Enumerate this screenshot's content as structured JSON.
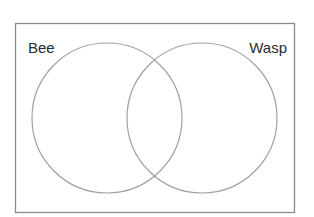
{
  "diagram": {
    "type": "venn",
    "frame": {
      "x": 15,
      "y": 23,
      "width": 279,
      "height": 189,
      "stroke": "#8a8a8a"
    },
    "sets": [
      {
        "label": "Bee",
        "cx": 107,
        "cy": 118,
        "r": 75,
        "label_x": 28,
        "label_y": 53,
        "anchor": "start"
      },
      {
        "label": "Wasp",
        "cx": 202,
        "cy": 118,
        "r": 75,
        "label_x": 287,
        "label_y": 53,
        "anchor": "end"
      }
    ],
    "circle_stroke": "#a0a0a0",
    "text_color": "#2b2b2b"
  }
}
